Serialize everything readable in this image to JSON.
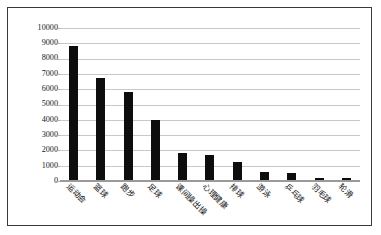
{
  "chart_data": {
    "type": "bar",
    "title": "",
    "subtitle": "",
    "xlabel": "",
    "ylabel": "",
    "ylim": [
      0,
      10000
    ],
    "ytick_step": 1000,
    "grid": true,
    "legend": false,
    "bar_color": "#0d0d0d",
    "gridline_color": "#c8c8c8",
    "border_color": "#3a3a3a",
    "yticks": [
      "10000",
      "9000",
      "8000",
      "7000",
      "6000",
      "5000",
      "4000",
      "3000",
      "2000",
      "1000",
      "0"
    ],
    "categories": [
      "运动会",
      "篮球",
      "跑步",
      "足球",
      "课间操出操",
      "心理健康",
      "排球",
      "游泳",
      "乒乓球",
      "羽毛球",
      "轮滑"
    ],
    "values": [
      8850,
      6750,
      5800,
      4000,
      1800,
      1700,
      1250,
      600,
      500,
      200,
      180
    ]
  }
}
